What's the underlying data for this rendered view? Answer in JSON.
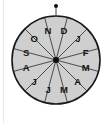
{
  "figure": {
    "name": "month-spinner",
    "background_color": "#ffffff"
  },
  "chart_data": {
    "type": "pie",
    "title": "",
    "subtitle": "",
    "xlabel": "",
    "ylabel": "",
    "legend_position": "none",
    "grid": false,
    "equal_slices": true,
    "slice_count": 12,
    "slice_value": 1,
    "start_angle_deg": -105,
    "direction": "clockwise",
    "categories": [
      "D",
      "J",
      "F",
      "M",
      "A",
      "M",
      "J",
      "J",
      "A",
      "S",
      "O",
      "N"
    ],
    "values": [
      1,
      1,
      1,
      1,
      1,
      1,
      1,
      1,
      1,
      1,
      1,
      1
    ],
    "labels": [
      "D",
      "J",
      "F",
      "M",
      "A",
      "M",
      "J",
      "J",
      "A",
      "S",
      "O",
      "N"
    ],
    "annotations": [
      "pointer dot at top",
      "hub dot at center"
    ]
  },
  "wheel": {
    "center_x": 56,
    "center_y": 60,
    "radius": 44,
    "fill_color": "#cfcfcf",
    "outline_color": "#1a1a1a",
    "spoke_color": "#3a3a3a",
    "label_color": "#161616",
    "labels": [
      {
        "text": "D",
        "angle_deg": -75
      },
      {
        "text": "J",
        "angle_deg": -45
      },
      {
        "text": "F",
        "angle_deg": -15
      },
      {
        "text": "M",
        "angle_deg": 15
      },
      {
        "text": "A",
        "angle_deg": 45
      },
      {
        "text": "M",
        "angle_deg": 75
      },
      {
        "text": "J",
        "angle_deg": 105
      },
      {
        "text": "J",
        "angle_deg": 135
      },
      {
        "text": "A",
        "angle_deg": 165
      },
      {
        "text": "S",
        "angle_deg": 195
      },
      {
        "text": "O",
        "angle_deg": 225
      },
      {
        "text": "N",
        "angle_deg": 255
      }
    ]
  },
  "pointer": {
    "name": "pointer-dot",
    "center_x": 56,
    "center_y": 6,
    "radius": 2,
    "color": "#0d0d0d",
    "stem_color": "#444444"
  },
  "hub": {
    "name": "hub-dot",
    "center_x": 56,
    "center_y": 60,
    "radius": 3,
    "color": "#0d0d0d"
  },
  "edge_rule": {
    "color": "#e9e9e9"
  }
}
